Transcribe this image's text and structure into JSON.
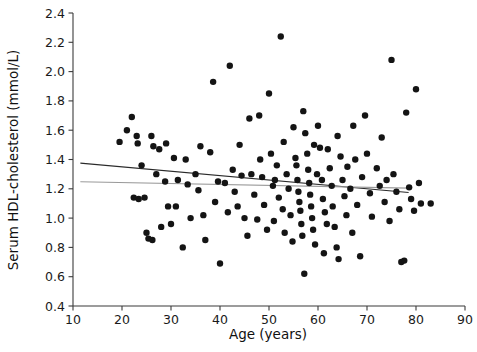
{
  "chart_data": {
    "type": "scatter",
    "title": "",
    "xlabel": "Age (years)",
    "ylabel": "Serum HDL-cholesterol  (mmol/L)",
    "xlim": [
      10,
      90
    ],
    "ylim": [
      0.4,
      2.4
    ],
    "xticks": [
      10,
      20,
      30,
      40,
      50,
      60,
      70,
      80,
      90
    ],
    "xtick_labels": [
      "10",
      "20",
      "30",
      "40",
      "50",
      "60",
      "70",
      "80",
      "90"
    ],
    "yticks": [
      0.4,
      0.6,
      0.8,
      1.0,
      1.2,
      1.4,
      1.6,
      1.8,
      2.0,
      2.2,
      2.4
    ],
    "ytick_labels": [
      "0.4",
      "0.6",
      "0.8",
      "1.0",
      "1.2",
      "1.4",
      "1.6",
      "1.8",
      "2.0",
      "2.2",
      "2.4"
    ],
    "grid": false,
    "legend": null,
    "marker": {
      "shape": "circle",
      "color": "#141414",
      "size_px": 4.2
    },
    "series": [
      {
        "name": "Participants",
        "points": [
          [
            19.5,
            1.52
          ],
          [
            21.0,
            1.6
          ],
          [
            22.0,
            1.69
          ],
          [
            23.0,
            1.56
          ],
          [
            23.2,
            1.51
          ],
          [
            22.4,
            1.14
          ],
          [
            23.4,
            1.13
          ],
          [
            24.6,
            1.14
          ],
          [
            25.0,
            0.9
          ],
          [
            26.0,
            1.56
          ],
          [
            26.4,
            1.49
          ],
          [
            24.0,
            1.36
          ],
          [
            27.0,
            1.3
          ],
          [
            28.8,
            1.25
          ],
          [
            29.4,
            1.08
          ],
          [
            25.4,
            0.86
          ],
          [
            26.2,
            0.85
          ],
          [
            28.0,
            0.94
          ],
          [
            30.6,
            1.41
          ],
          [
            31.4,
            1.26
          ],
          [
            31.0,
            1.08
          ],
          [
            30.0,
            0.96
          ],
          [
            32.4,
            0.8
          ],
          [
            33.4,
            1.23
          ],
          [
            34.0,
            1.0
          ],
          [
            35.0,
            1.3
          ],
          [
            36.0,
            1.49
          ],
          [
            36.6,
            1.02
          ],
          [
            37.0,
            0.85
          ],
          [
            38.0,
            1.45
          ],
          [
            38.6,
            1.93
          ],
          [
            39.6,
            1.25
          ],
          [
            39.0,
            1.11
          ],
          [
            40.0,
            0.69
          ],
          [
            41.0,
            1.24
          ],
          [
            41.6,
            1.04
          ],
          [
            42.0,
            2.04
          ],
          [
            42.6,
            1.33
          ],
          [
            43.0,
            1.18
          ],
          [
            43.6,
            1.08
          ],
          [
            44.4,
            1.29
          ],
          [
            45.0,
            1.0
          ],
          [
            45.6,
            0.88
          ],
          [
            46.4,
            1.3
          ],
          [
            47.0,
            1.16
          ],
          [
            47.6,
            0.99
          ],
          [
            48.0,
            1.7
          ],
          [
            48.6,
            1.28
          ],
          [
            49.0,
            1.09
          ],
          [
            49.6,
            0.92
          ],
          [
            50.0,
            1.85
          ],
          [
            50.4,
            1.44
          ],
          [
            50.8,
            1.22
          ],
          [
            51.0,
            0.98
          ],
          [
            51.6,
            1.36
          ],
          [
            52.0,
            1.14
          ],
          [
            52.4,
            2.24
          ],
          [
            52.8,
            1.06
          ],
          [
            53.0,
            1.52
          ],
          [
            53.6,
            1.3
          ],
          [
            54.0,
            1.2
          ],
          [
            54.4,
            1.02
          ],
          [
            54.8,
            0.84
          ],
          [
            55.0,
            1.62
          ],
          [
            55.4,
            1.41
          ],
          [
            55.6,
            1.36
          ],
          [
            55.8,
            1.26
          ],
          [
            56.0,
            1.18
          ],
          [
            56.2,
            1.11
          ],
          [
            56.4,
            1.05
          ],
          [
            56.6,
            0.96
          ],
          [
            56.8,
            0.88
          ],
          [
            57.0,
            1.73
          ],
          [
            57.4,
            1.58
          ],
          [
            57.8,
            1.44
          ],
          [
            58.0,
            1.33
          ],
          [
            58.2,
            1.24
          ],
          [
            58.4,
            1.16
          ],
          [
            58.6,
            1.08
          ],
          [
            58.8,
            1.0
          ],
          [
            59.0,
            0.92
          ],
          [
            59.4,
            0.82
          ],
          [
            59.8,
            1.3
          ],
          [
            60.0,
            1.63
          ],
          [
            60.4,
            1.48
          ],
          [
            60.8,
            1.26
          ],
          [
            61.0,
            1.13
          ],
          [
            61.4,
            1.04
          ],
          [
            61.8,
            0.96
          ],
          [
            62.0,
            1.47
          ],
          [
            62.4,
            1.34
          ],
          [
            62.8,
            1.22
          ],
          [
            63.0,
            1.08
          ],
          [
            63.4,
            0.94
          ],
          [
            63.8,
            0.8
          ],
          [
            64.0,
            1.56
          ],
          [
            64.6,
            1.42
          ],
          [
            65.0,
            1.26
          ],
          [
            65.4,
            1.15
          ],
          [
            65.8,
            1.02
          ],
          [
            66.0,
            1.35
          ],
          [
            66.6,
            1.2
          ],
          [
            67.0,
            0.9
          ],
          [
            67.6,
            1.4
          ],
          [
            68.0,
            1.09
          ],
          [
            68.6,
            0.74
          ],
          [
            69.0,
            1.28
          ],
          [
            70.0,
            1.44
          ],
          [
            70.6,
            1.17
          ],
          [
            71.0,
            1.01
          ],
          [
            72.0,
            1.34
          ],
          [
            72.6,
            1.22
          ],
          [
            73.0,
            1.55
          ],
          [
            73.6,
            1.11
          ],
          [
            74.0,
            1.26
          ],
          [
            74.6,
            0.98
          ],
          [
            75.0,
            2.08
          ],
          [
            75.4,
            1.3
          ],
          [
            76.0,
            1.18
          ],
          [
            76.6,
            1.06
          ],
          [
            77.0,
            0.7
          ],
          [
            77.6,
            0.71
          ],
          [
            78.0,
            1.72
          ],
          [
            78.6,
            1.21
          ],
          [
            79.0,
            1.13
          ],
          [
            79.6,
            1.05
          ],
          [
            80.0,
            1.88
          ],
          [
            80.6,
            1.24
          ],
          [
            81.0,
            1.1
          ],
          [
            83.0,
            1.1
          ],
          [
            33.0,
            1.4
          ],
          [
            35.6,
            1.19
          ],
          [
            29.0,
            1.51
          ],
          [
            27.6,
            1.47
          ],
          [
            44.0,
            1.5
          ],
          [
            46.0,
            1.68
          ],
          [
            51.2,
            1.26
          ],
          [
            53.2,
            0.9
          ],
          [
            57.2,
            0.62
          ],
          [
            61.2,
            0.76
          ],
          [
            64.2,
            0.72
          ],
          [
            67.2,
            1.63
          ],
          [
            69.6,
            1.7
          ],
          [
            59.2,
            1.5
          ],
          [
            48.2,
            1.4
          ]
        ]
      }
    ],
    "fit_lines": [
      {
        "name": "regression-line-primary",
        "color": "#2a2a2a",
        "x_start": 11.5,
        "y_start": 1.375,
        "x_end": 78.5,
        "y_end": 1.175
      },
      {
        "name": "regression-line-secondary",
        "color": "#9a9a9a",
        "x_start": 11.5,
        "y_start": 1.248,
        "x_end": 78.5,
        "y_end": 1.205
      }
    ]
  }
}
